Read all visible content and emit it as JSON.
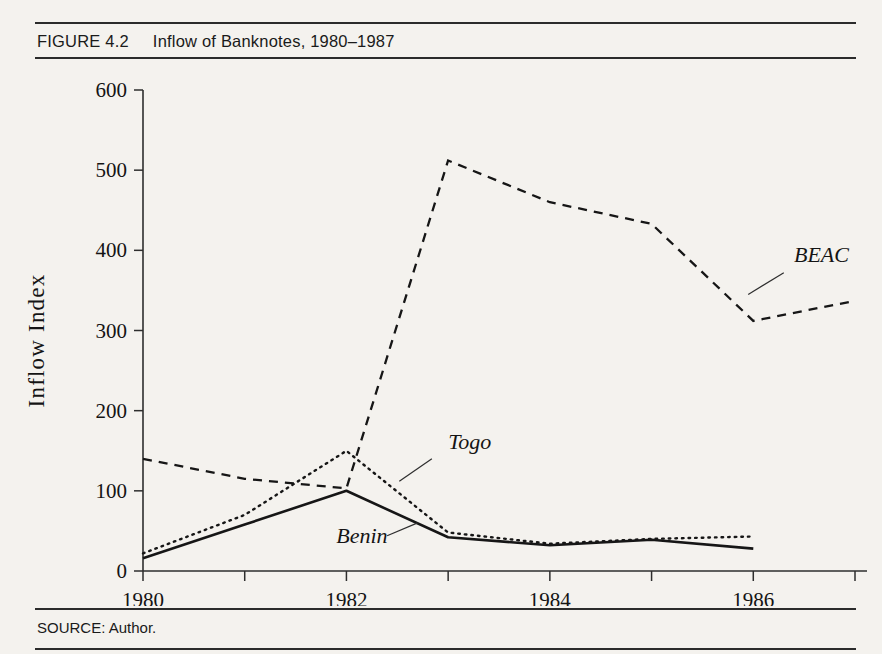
{
  "figure": {
    "number": "FIGURE 4.2",
    "title": "Inflow of Banknotes, 1980–1987",
    "source": "SOURCE: Author."
  },
  "chart_data": {
    "type": "line",
    "title": "Inflow of Banknotes, 1980–1987",
    "xlabel": "",
    "ylabel": "Inflow  Index",
    "xlim": [
      1980,
      1987
    ],
    "ylim": [
      0,
      600
    ],
    "grid": false,
    "legend_position": "inline-annotations",
    "x": [
      1980,
      1981,
      1982,
      1983,
      1984,
      1985,
      1986,
      1987
    ],
    "xtick_labels": [
      "1980",
      "1982",
      "1984",
      "1986"
    ],
    "xtick_values": [
      1980,
      1982,
      1984,
      1986
    ],
    "ytick_labels": [
      "0",
      "100",
      "200",
      "300",
      "400",
      "500",
      "600"
    ],
    "ytick_values": [
      0,
      100,
      200,
      300,
      400,
      500,
      600
    ],
    "series": [
      {
        "name": "BEAC",
        "style": "dashed",
        "color": "#161616",
        "x": [
          1980,
          1981,
          1982,
          1983,
          1984,
          1985,
          1986,
          1987
        ],
        "values": [
          140,
          115,
          103,
          512,
          460,
          433,
          312,
          337
        ]
      },
      {
        "name": "Togo",
        "style": "dotted",
        "color": "#161616",
        "x": [
          1980,
          1981,
          1982,
          1983,
          1984,
          1985,
          1986
        ],
        "values": [
          22,
          70,
          150,
          48,
          34,
          40,
          43
        ]
      },
      {
        "name": "Benin",
        "style": "solid",
        "color": "#161616",
        "x": [
          1980,
          1981,
          1982,
          1983,
          1984,
          1985,
          1986
        ],
        "values": [
          16,
          58,
          100,
          42,
          32,
          39,
          28
        ]
      }
    ],
    "annotations": [
      {
        "text": "BEAC",
        "x": 1986.4,
        "y": 385
      },
      {
        "text": "Togo",
        "x": 1983.0,
        "y": 152
      },
      {
        "text": "Benin",
        "x": 1981.9,
        "y": 35
      }
    ]
  }
}
